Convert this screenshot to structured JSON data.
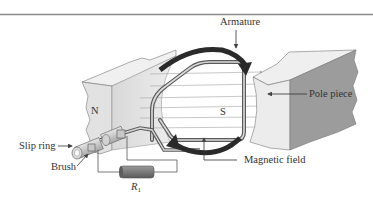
{
  "figure": {
    "labels": {
      "armature": "Armature",
      "pole_piece": "Pole piece",
      "slip_ring": "Slip ring",
      "brush": "Brush",
      "magnetic_field": "Magnetic field",
      "north_pole": "N",
      "south_pole": "S",
      "resistor": "R",
      "resistor_subscript": "1"
    },
    "colors": {
      "rule": "#8a8a8a",
      "pole_face": "#9a9a9a",
      "pole_light": "#e4e4e4",
      "wire": "#555555",
      "rotation_arrow": "#2a2a2a",
      "field_line": "#a0a0a0",
      "text": "#333333"
    }
  }
}
